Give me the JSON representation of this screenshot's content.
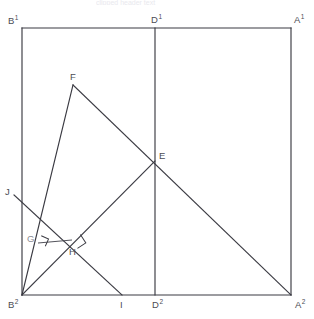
{
  "figure": {
    "canvas": {
      "width": 314,
      "height": 319
    },
    "background_color": "#ffffff",
    "line_color": "#3a3a42",
    "label_color": "#4c4c54",
    "dim_label_color": "#8a8a92"
  },
  "top_artifact": {
    "text": "clipped header text"
  },
  "points": {
    "B1": {
      "x": 22,
      "y": 28,
      "label": "B",
      "superscript": "1",
      "label_dx": -14,
      "label_dy": -4,
      "dim": false
    },
    "D1": {
      "x": 155,
      "y": 28,
      "label": "D",
      "superscript": "1",
      "label_dx": -4,
      "label_dy": -5,
      "dim": false
    },
    "A1": {
      "x": 291,
      "y": 28,
      "label": "A",
      "superscript": "1",
      "label_dx": 3,
      "label_dy": -5,
      "dim": false
    },
    "B2": {
      "x": 22,
      "y": 295,
      "label": "B",
      "superscript": "2",
      "label_dx": -14,
      "label_dy": 13,
      "dim": false
    },
    "D2": {
      "x": 155,
      "y": 295,
      "label": "D",
      "superscript": "2",
      "label_dx": -3,
      "label_dy": 13,
      "dim": false
    },
    "A2": {
      "x": 291,
      "y": 295,
      "label": "A",
      "superscript": "2",
      "label_dx": 4,
      "label_dy": 13,
      "dim": false
    },
    "E": {
      "x": 155,
      "y": 161,
      "label": "E",
      "superscript": "",
      "label_dx": 4,
      "label_dy": -2,
      "dim": false
    },
    "F": {
      "x": 73,
      "y": 85,
      "label": "F",
      "superscript": "",
      "label_dx": -3,
      "label_dy": -5,
      "dim": false
    },
    "G": {
      "x": 38,
      "y": 243,
      "label": "G",
      "superscript": "",
      "label_dx": -11,
      "label_dy": -1,
      "dim": true
    },
    "H": {
      "x": 72,
      "y": 240,
      "label": "H",
      "superscript": "",
      "label_dx": -3,
      "label_dy": 15,
      "dim": false
    },
    "I": {
      "x": 122,
      "y": 295,
      "label": "I",
      "superscript": "",
      "label_dx": -2,
      "label_dy": 13,
      "dim": false
    },
    "J": {
      "x": 14,
      "y": 195,
      "label": "J",
      "superscript": "",
      "label_dx": -9,
      "label_dy": 0,
      "dim": false
    }
  },
  "segments": [
    {
      "name": "square-top-edge",
      "from": "B1",
      "to": "A1",
      "kind": "edge"
    },
    {
      "name": "square-left-edge",
      "from": "B1",
      "to": "B2",
      "kind": "edge"
    },
    {
      "name": "square-right-edge",
      "from": "A1",
      "to": "A2",
      "kind": "edge"
    },
    {
      "name": "square-bottom-edge",
      "from": "B2",
      "to": "A2",
      "kind": "edge"
    },
    {
      "name": "median-vertical-D1-D2",
      "from": "D1",
      "to": "D2",
      "kind": "construction"
    },
    {
      "name": "line-F-to-A2",
      "from": "F",
      "to": "A2",
      "kind": "construction"
    },
    {
      "name": "line-B2-to-E",
      "from": "B2",
      "to": "E",
      "kind": "construction"
    },
    {
      "name": "line-B2-to-F",
      "from": "B2",
      "to": "F",
      "kind": "construction"
    },
    {
      "name": "line-J-to-I",
      "from": "J",
      "to": "I",
      "kind": "construction"
    },
    {
      "name": "segment-G-to-H",
      "from": "G",
      "to": "H",
      "kind": "thin"
    }
  ],
  "right_angles": [
    {
      "name": "right-angle-at-G",
      "at": "G",
      "size": 8,
      "rotation": 24
    },
    {
      "name": "right-angle-at-H",
      "at": "H",
      "size": 10,
      "rotation": 57
    }
  ],
  "labels_legend": {
    "B1": "B1",
    "D1": "D1",
    "A1": "A1",
    "B2": "B2",
    "D2": "D2",
    "A2": "A2",
    "E": "E",
    "F": "F",
    "G": "G",
    "H": "H",
    "I": "I",
    "J": "J"
  }
}
